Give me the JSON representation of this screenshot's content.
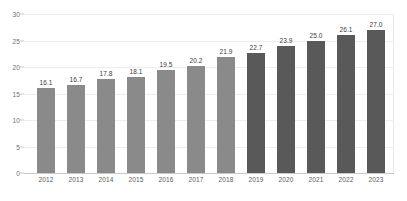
{
  "chart_data": {
    "type": "bar",
    "title": "",
    "xlabel": "",
    "ylabel": "",
    "ylim": [
      0,
      30
    ],
    "ytick_values": [
      "0",
      "5",
      "10",
      "15",
      "20",
      "25",
      "30"
    ],
    "grid": true,
    "legend": "none",
    "categories": [
      "2012",
      "2013",
      "2014",
      "2015",
      "2016",
      "2017",
      "2018",
      "2019",
      "2020",
      "2021",
      "2022",
      "2023"
    ],
    "values": [
      16.1,
      16.7,
      17.8,
      18.1,
      19.5,
      20.2,
      21.9,
      22.7,
      23.9,
      25.0,
      26.1,
      27.0
    ],
    "value_labels": [
      "16.1",
      "16.7",
      "17.8",
      "18.1",
      "19.5",
      "20.2",
      "21.9",
      "22.7",
      "23.9",
      "25.0",
      "26.1",
      "27.0"
    ],
    "bar_colors": [
      "#8a8a8a",
      "#8a8a8a",
      "#8a8a8a",
      "#8a8a8a",
      "#8a8a8a",
      "#8a8a8a",
      "#8a8a8a",
      "#595959",
      "#595959",
      "#595959",
      "#595959",
      "#595959"
    ],
    "colors": {
      "series_light": "#8a8a8a",
      "series_dark": "#595959",
      "gridline": "#ededed",
      "axis": "#c9c9c9",
      "label_text": "#3a3a3a",
      "tick_text": "#6d6d6d",
      "background": "#ffffff"
    }
  }
}
